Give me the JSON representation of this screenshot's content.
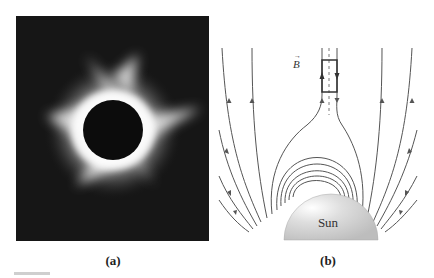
{
  "figure": {
    "panels": [
      {
        "id": "a",
        "caption": "(a)",
        "description": "Photograph of total solar eclipse showing solar corona around dark lunar disk"
      },
      {
        "id": "b",
        "caption": "(b)",
        "description": "Magnetic field lines emerging from the Sun; closed loops near surface, open field lines above, with a rectangular loop straddling a current sheet",
        "labels": {
          "sun": "Sun",
          "field": "B",
          "field_vector_symbol": "→"
        }
      }
    ]
  },
  "colors": {
    "background": "#ffffff",
    "photo_bg": "#161616",
    "corona": "#f2f2f2",
    "moon_disk": "#0c0c0c",
    "field_lines": "#555555",
    "sun_fill": "#d9d9d9"
  }
}
